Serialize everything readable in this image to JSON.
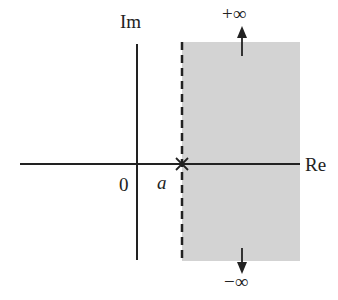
{
  "diagram": {
    "type": "complex-plane-region",
    "axes": {
      "real_label": "Re",
      "imag_label": "Im",
      "origin_label": "0"
    },
    "point": {
      "label": "a",
      "marker": "cross"
    },
    "region": {
      "description": "half-plane Re(s) > a",
      "boundary": "dashed vertical line at a",
      "fill": "#d3d3d3"
    },
    "arrows": {
      "top_label": "+∞",
      "bottom_label": "−∞"
    },
    "colors": {
      "axis": "#222222",
      "shade": "#d3d3d3"
    }
  }
}
